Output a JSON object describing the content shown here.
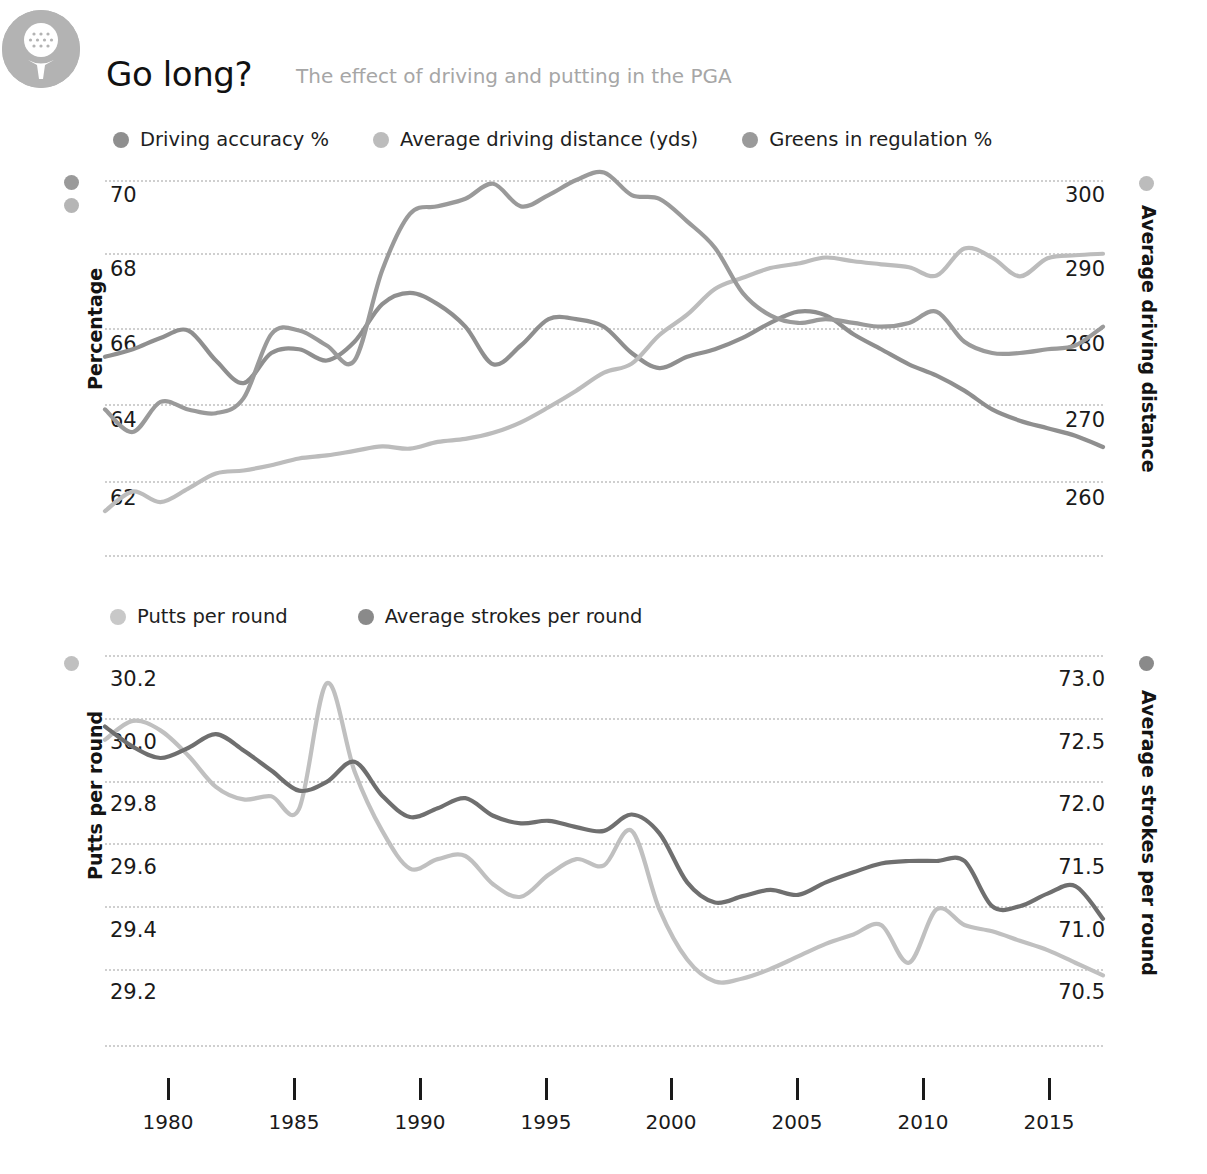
{
  "header": {
    "logo_icon": "golf-ball-on-tee-icon",
    "title": "Go long?",
    "subtitle": "The effect of driving and putting in the PGA"
  },
  "colors": {
    "driving_accuracy": "#8f8f8f",
    "driving_distance": "#bcbcbc",
    "greens_in_regulation": "#9a9a9a",
    "putts_per_round": "#c0c0c0",
    "strokes_per_round": "#6f6f6f",
    "logo_bg": "#b3b3b3",
    "gridline": "#cfcfcf",
    "title": "#111111",
    "subtitle": "#a6a6a6"
  },
  "legends": {
    "top": [
      {
        "label": "Driving accuracy %",
        "color": "#8f8f8f"
      },
      {
        "label": "Average driving distance (yds)",
        "color": "#bcbcbc"
      },
      {
        "label": "Greens in regulation %",
        "color": "#9a9a9a"
      }
    ],
    "bottom": [
      {
        "label": "Putts per round",
        "color": "#c0c0c0"
      },
      {
        "label": "Average strokes per round",
        "color": "#6f6f6f"
      }
    ]
  },
  "axes": {
    "top_left_title": "Percentage",
    "top_right_title": "Average driving distance",
    "bottom_left_title": "Putts per round",
    "bottom_right_title": "Average strokes per round",
    "top_left_ticks": [
      "70",
      "68",
      "66",
      "64",
      "62"
    ],
    "top_right_ticks": [
      "300",
      "290",
      "280",
      "270",
      "260"
    ],
    "bottom_left_ticks": [
      "30.2",
      "30.0",
      "29.8",
      "29.6",
      "29.4",
      "29.2"
    ],
    "bottom_right_ticks": [
      "73.0",
      "72.5",
      "72.0",
      "71.5",
      "71.0",
      "70.5"
    ],
    "x_ticks": [
      "1980",
      "1985",
      "1990",
      "1995",
      "2000",
      "2005",
      "2010",
      "2015"
    ]
  },
  "chart_data": [
    {
      "type": "line",
      "title": "Go long?",
      "subtitle": "The effect of driving and putting in the PGA",
      "xlabel": "",
      "ylabel": "Percentage",
      "y2label": "Average driving distance",
      "ylim": [
        61,
        71
      ],
      "y2lim": [
        255,
        305
      ],
      "xlim": [
        1980,
        2016
      ],
      "grid": true,
      "legend_position": "top",
      "x": [
        1980,
        1981,
        1982,
        1983,
        1984,
        1985,
        1986,
        1987,
        1988,
        1989,
        1990,
        1991,
        1992,
        1993,
        1994,
        1995,
        1996,
        1997,
        1998,
        1999,
        2000,
        2001,
        2002,
        2003,
        2004,
        2005,
        2006,
        2007,
        2008,
        2009,
        2010,
        2011,
        2012,
        2013,
        2014,
        2015,
        2016
      ],
      "series": [
        {
          "name": "Driving accuracy %",
          "axis": "left",
          "color": "#8f8f8f",
          "units": "%",
          "values": [
            65.3,
            65.5,
            65.8,
            66.0,
            65.2,
            64.6,
            65.4,
            65.5,
            65.2,
            65.7,
            66.7,
            67.0,
            66.7,
            66.1,
            65.1,
            65.6,
            66.3,
            66.3,
            66.1,
            65.4,
            65.0,
            65.3,
            65.5,
            65.8,
            66.2,
            66.5,
            66.4,
            65.9,
            65.5,
            65.1,
            64.8,
            64.4,
            63.9,
            63.6,
            63.4,
            63.2,
            62.9
          ]
        },
        {
          "name": "Average driving distance (yds)",
          "axis": "right",
          "color": "#bcbcbc",
          "units": "yds",
          "values": [
            256.0,
            258.6,
            257.2,
            259.0,
            261.0,
            261.4,
            262.1,
            263.0,
            263.4,
            264.0,
            264.6,
            264.3,
            265.2,
            265.6,
            266.4,
            267.8,
            269.8,
            272.0,
            274.4,
            275.6,
            279.4,
            282.1,
            285.5,
            287.0,
            288.3,
            288.9,
            289.7,
            289.2,
            288.8,
            288.4,
            287.3,
            290.9,
            289.7,
            287.2,
            289.6,
            290.0,
            290.2
          ]
        },
        {
          "name": "Greens in regulation %",
          "axis": "left",
          "color": "#9a9a9a",
          "units": "%",
          "values": [
            63.9,
            63.3,
            64.1,
            63.9,
            63.8,
            64.2,
            65.9,
            66.0,
            65.6,
            65.2,
            67.6,
            69.1,
            69.3,
            69.5,
            69.9,
            69.3,
            69.6,
            70.0,
            70.2,
            69.6,
            69.5,
            68.9,
            68.2,
            67.0,
            66.4,
            66.2,
            66.3,
            66.2,
            66.1,
            66.2,
            66.5,
            65.7,
            65.4,
            65.4,
            65.5,
            65.6,
            66.1
          ]
        }
      ]
    },
    {
      "type": "line",
      "title": "",
      "xlabel": "",
      "ylabel": "Putts per round",
      "y2label": "Average strokes per round",
      "ylim": [
        29.05,
        30.3
      ],
      "y2lim": [
        70.2,
        73.25
      ],
      "xlim": [
        1980,
        2016
      ],
      "grid": true,
      "legend_position": "top",
      "x": [
        1980,
        1981,
        1982,
        1983,
        1984,
        1985,
        1986,
        1987,
        1988,
        1989,
        1990,
        1991,
        1992,
        1993,
        1994,
        1995,
        1996,
        1997,
        1998,
        1999,
        2000,
        2001,
        2002,
        2003,
        2004,
        2005,
        2006,
        2007,
        2008,
        2009,
        2010,
        2011,
        2012,
        2013,
        2014,
        2015,
        2016
      ],
      "series": [
        {
          "name": "Putts per round",
          "axis": "left",
          "color": "#c0c0c0",
          "values": [
            29.93,
            29.99,
            29.96,
            29.88,
            29.78,
            29.74,
            29.75,
            29.71,
            30.11,
            29.83,
            29.64,
            29.52,
            29.55,
            29.56,
            29.47,
            29.43,
            29.5,
            29.55,
            29.53,
            29.64,
            29.39,
            29.23,
            29.16,
            29.17,
            29.2,
            29.24,
            29.28,
            29.31,
            29.34,
            29.22,
            29.39,
            29.34,
            29.32,
            29.29,
            29.26,
            29.22,
            29.18
          ]
        },
        {
          "name": "Average strokes per round",
          "axis": "right",
          "color": "#6f6f6f",
          "values": [
            72.43,
            72.27,
            72.18,
            72.26,
            72.37,
            72.24,
            72.08,
            71.92,
            71.99,
            72.15,
            71.88,
            71.71,
            71.78,
            71.86,
            71.72,
            71.66,
            71.68,
            71.63,
            71.6,
            71.73,
            71.58,
            71.19,
            71.03,
            71.08,
            71.13,
            71.09,
            71.19,
            71.27,
            71.34,
            71.36,
            71.36,
            71.36,
            71.0,
            71.0,
            71.1,
            71.16,
            70.9
          ]
        }
      ]
    }
  ]
}
